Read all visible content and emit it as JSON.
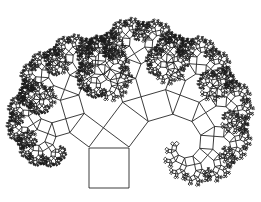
{
  "figure": {
    "title": "Pythagoras tree"
  },
  "tree": {
    "base_square": {
      "top_left": [
        89,
        147
      ],
      "top_right": [
        129,
        147
      ],
      "side": 41
    },
    "left_ratio": 0.6,
    "right_ratio": 0.8,
    "triangle": "3-4-5",
    "depth": 11,
    "min_side_px": 0.9
  },
  "colors": {
    "background": "#ffffff",
    "stroke": "#1a1a1a"
  },
  "stroke_width": 0.85
}
